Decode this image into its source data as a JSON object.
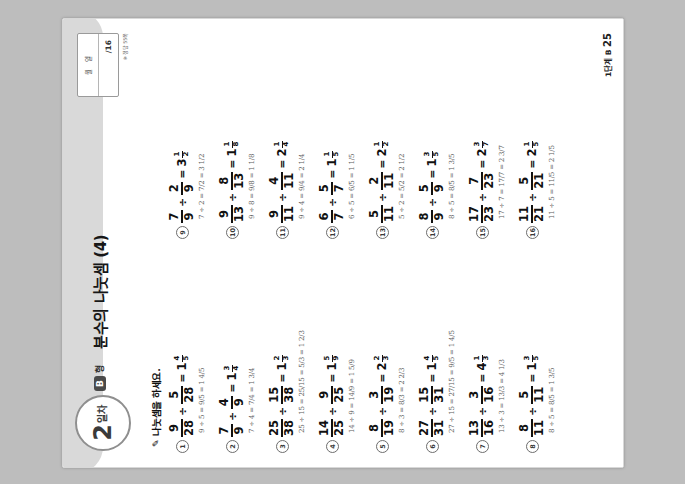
{
  "page": {
    "badge_number": "2",
    "badge_suffix": "일차",
    "level_chip": "B",
    "level_word": "형",
    "title": "분수의 나눗셈 (4)",
    "datebox": {
      "month_label": "월",
      "day_label": "일",
      "name_label": "이름",
      "score": "/16"
    },
    "answer_note": "※ 정답 55쪽",
    "instruction": "나눗셈을 하세요.",
    "pencil_icon": "pencil-icon",
    "footer_label": "1단계 B",
    "footer_page": "25"
  },
  "problems": [
    {
      "no": "1",
      "n1": "9",
      "d1": "28",
      "n2": "5",
      "d2": "28",
      "whole": "1",
      "rn": "4",
      "rd": "5",
      "work": "9 ÷ 5 = 9/5 = 1 4/5"
    },
    {
      "no": "2",
      "n1": "7",
      "d1": "9",
      "n2": "4",
      "d2": "9",
      "whole": "1",
      "rn": "3",
      "rd": "4",
      "work": "7 ÷ 4 = 7/4 = 1 3/4"
    },
    {
      "no": "3",
      "n1": "25",
      "d1": "38",
      "n2": "15",
      "d2": "38",
      "whole": "1",
      "rn": "2",
      "rd": "3",
      "work": "25 ÷ 15 = 25/15 = 5/3 = 1 2/3"
    },
    {
      "no": "4",
      "n1": "14",
      "d1": "25",
      "n2": "9",
      "d2": "25",
      "whole": "1",
      "rn": "5",
      "rd": "9",
      "work": "14 ÷ 9 = 14/9 = 1 5/9"
    },
    {
      "no": "5",
      "n1": "8",
      "d1": "19",
      "n2": "3",
      "d2": "19",
      "whole": "2",
      "rn": "2",
      "rd": "3",
      "work": "8 ÷ 3 = 8/3 = 2 2/3"
    },
    {
      "no": "6",
      "n1": "27",
      "d1": "31",
      "n2": "15",
      "d2": "31",
      "whole": "1",
      "rn": "4",
      "rd": "5",
      "work": "27 ÷ 15 = 27/15 = 9/5 = 1 4/5"
    },
    {
      "no": "7",
      "n1": "13",
      "d1": "16",
      "n2": "3",
      "d2": "16",
      "whole": "4",
      "rn": "1",
      "rd": "3",
      "work": "13 ÷ 3 = 13/3 = 4 1/3"
    },
    {
      "no": "8",
      "n1": "8",
      "d1": "11",
      "n2": "5",
      "d2": "11",
      "whole": "1",
      "rn": "3",
      "rd": "5",
      "work": "8 ÷ 5 = 8/5 = 1 3/5"
    },
    {
      "no": "9",
      "n1": "7",
      "d1": "9",
      "n2": "2",
      "d2": "9",
      "whole": "3",
      "rn": "1",
      "rd": "2",
      "work": "7 ÷ 2 = 7/2 = 3 1/2"
    },
    {
      "no": "10",
      "n1": "9",
      "d1": "13",
      "n2": "8",
      "d2": "13",
      "whole": "1",
      "rn": "1",
      "rd": "8",
      "work": "9 ÷ 8 = 9/8 = 1 1/8"
    },
    {
      "no": "11",
      "n1": "9",
      "d1": "11",
      "n2": "4",
      "d2": "11",
      "whole": "2",
      "rn": "1",
      "rd": "4",
      "work": "9 ÷ 4 = 9/4 = 2 1/4"
    },
    {
      "no": "12",
      "n1": "6",
      "d1": "7",
      "n2": "5",
      "d2": "7",
      "whole": "1",
      "rn": "1",
      "rd": "5",
      "work": "6 ÷ 5 = 6/5 = 1 1/5"
    },
    {
      "no": "13",
      "n1": "5",
      "d1": "11",
      "n2": "2",
      "d2": "11",
      "whole": "2",
      "rn": "1",
      "rd": "2",
      "work": "5 ÷ 2 = 5/2 = 2 1/2"
    },
    {
      "no": "14",
      "n1": "8",
      "d1": "9",
      "n2": "5",
      "d2": "9",
      "whole": "1",
      "rn": "3",
      "rd": "5",
      "work": "8 ÷ 5 = 8/5 = 1 3/5"
    },
    {
      "no": "15",
      "n1": "17",
      "d1": "23",
      "n2": "7",
      "d2": "23",
      "whole": "2",
      "rn": "3",
      "rd": "7",
      "work": "17 ÷ 7 = 17/7 = 2 3/7"
    },
    {
      "no": "16",
      "n1": "11",
      "d1": "21",
      "n2": "5",
      "d2": "21",
      "whole": "2",
      "rn": "1",
      "rd": "5",
      "work": "11 ÷ 5 = 11/5 = 2 1/5"
    }
  ],
  "symbols": {
    "divide": "÷",
    "equals": "="
  }
}
